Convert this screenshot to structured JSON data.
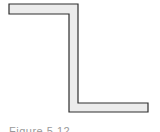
{
  "figure": {
    "shape": "z-section",
    "fill_color": "#ececec",
    "stroke_color": "#2e2e2e",
    "stroke_width": 1.2,
    "outline_points": "9,4 78,4 78,103 148,103 148,112 69,112 69,14 9,14",
    "caption": "Figure 5.12"
  }
}
